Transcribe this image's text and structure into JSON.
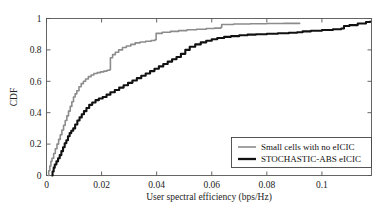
{
  "chart_data": {
    "type": "line",
    "title": "",
    "xlabel": "User spectral efficiency (bps/Hz)",
    "ylabel": "CDF",
    "xlim": [
      0,
      0.118
    ],
    "ylim": [
      0,
      1
    ],
    "xticks": [
      0,
      0.02,
      0.04,
      0.06,
      0.08,
      0.1
    ],
    "xticklabels": [
      "0",
      "0.02",
      "0.04",
      "0.06",
      "0.08",
      "0.1"
    ],
    "yticks": [
      0,
      0.2,
      0.4,
      0.6,
      0.8,
      1
    ],
    "yticklabels": [
      "0",
      "0.2",
      "0.4",
      "0.6",
      "0.8",
      "1"
    ],
    "grid": false,
    "legend_position": "lower right",
    "series": [
      {
        "name": "Small cells with no eICIC",
        "color": "#8c8c8c",
        "linewidth": 1.6,
        "points": [
          [
            0.0005,
            0.0
          ],
          [
            0.0008,
            0.03
          ],
          [
            0.0012,
            0.06
          ],
          [
            0.0016,
            0.09
          ],
          [
            0.002,
            0.11
          ],
          [
            0.0026,
            0.14
          ],
          [
            0.0032,
            0.17
          ],
          [
            0.0038,
            0.2
          ],
          [
            0.0044,
            0.23
          ],
          [
            0.005,
            0.26
          ],
          [
            0.0056,
            0.29
          ],
          [
            0.0062,
            0.32
          ],
          [
            0.0068,
            0.35
          ],
          [
            0.0074,
            0.38
          ],
          [
            0.008,
            0.41
          ],
          [
            0.0086,
            0.44
          ],
          [
            0.0092,
            0.47
          ],
          [
            0.0098,
            0.5
          ],
          [
            0.0104,
            0.52
          ],
          [
            0.011,
            0.54
          ],
          [
            0.0118,
            0.565
          ],
          [
            0.0126,
            0.585
          ],
          [
            0.0134,
            0.6
          ],
          [
            0.0142,
            0.615
          ],
          [
            0.0152,
            0.63
          ],
          [
            0.0162,
            0.64
          ],
          [
            0.0172,
            0.65
          ],
          [
            0.0184,
            0.655
          ],
          [
            0.0196,
            0.66
          ],
          [
            0.0208,
            0.665
          ],
          [
            0.022,
            0.67
          ],
          [
            0.023,
            0.675
          ],
          [
            0.0232,
            0.75
          ],
          [
            0.024,
            0.77
          ],
          [
            0.025,
            0.785
          ],
          [
            0.0262,
            0.8
          ],
          [
            0.0276,
            0.815
          ],
          [
            0.029,
            0.825
          ],
          [
            0.0306,
            0.835
          ],
          [
            0.0322,
            0.845
          ],
          [
            0.034,
            0.85
          ],
          [
            0.036,
            0.855
          ],
          [
            0.038,
            0.86
          ],
          [
            0.0394,
            0.865
          ],
          [
            0.0398,
            0.905
          ],
          [
            0.042,
            0.912
          ],
          [
            0.045,
            0.918
          ],
          [
            0.048,
            0.923
          ],
          [
            0.051,
            0.928
          ],
          [
            0.0545,
            0.932
          ],
          [
            0.058,
            0.936
          ],
          [
            0.061,
            0.939
          ],
          [
            0.0632,
            0.942
          ],
          [
            0.0636,
            0.962
          ],
          [
            0.068,
            0.965
          ],
          [
            0.074,
            0.967
          ],
          [
            0.08,
            0.968
          ],
          [
            0.086,
            0.969
          ],
          [
            0.092,
            0.97
          ]
        ]
      },
      {
        "name": "STOCHASTIC-ABS eICIC",
        "color": "#111111",
        "linewidth": 2.1,
        "points": [
          [
            0.0018,
            0.0
          ],
          [
            0.0022,
            0.025
          ],
          [
            0.0026,
            0.05
          ],
          [
            0.003,
            0.07
          ],
          [
            0.0036,
            0.09
          ],
          [
            0.0042,
            0.11
          ],
          [
            0.0048,
            0.13
          ],
          [
            0.0054,
            0.155
          ],
          [
            0.006,
            0.18
          ],
          [
            0.0066,
            0.205
          ],
          [
            0.0072,
            0.225
          ],
          [
            0.0078,
            0.25
          ],
          [
            0.0084,
            0.27
          ],
          [
            0.009,
            0.285
          ],
          [
            0.0097,
            0.3
          ],
          [
            0.0104,
            0.325
          ],
          [
            0.0112,
            0.35
          ],
          [
            0.012,
            0.37
          ],
          [
            0.0128,
            0.39
          ],
          [
            0.0136,
            0.41
          ],
          [
            0.0145,
            0.43
          ],
          [
            0.0155,
            0.45
          ],
          [
            0.0166,
            0.465
          ],
          [
            0.0178,
            0.48
          ],
          [
            0.019,
            0.49
          ],
          [
            0.0204,
            0.5
          ],
          [
            0.0218,
            0.515
          ],
          [
            0.0232,
            0.53
          ],
          [
            0.0248,
            0.545
          ],
          [
            0.0264,
            0.56
          ],
          [
            0.028,
            0.575
          ],
          [
            0.0296,
            0.59
          ],
          [
            0.0312,
            0.605
          ],
          [
            0.0328,
            0.62
          ],
          [
            0.0344,
            0.635
          ],
          [
            0.036,
            0.65
          ],
          [
            0.0376,
            0.665
          ],
          [
            0.0392,
            0.68
          ],
          [
            0.0408,
            0.695
          ],
          [
            0.0424,
            0.71
          ],
          [
            0.044,
            0.725
          ],
          [
            0.0456,
            0.74
          ],
          [
            0.0472,
            0.755
          ],
          [
            0.0488,
            0.775
          ],
          [
            0.0504,
            0.8
          ],
          [
            0.052,
            0.82
          ],
          [
            0.054,
            0.835
          ],
          [
            0.056,
            0.848
          ],
          [
            0.058,
            0.858
          ],
          [
            0.06,
            0.868
          ],
          [
            0.062,
            0.876
          ],
          [
            0.0645,
            0.883
          ],
          [
            0.067,
            0.888
          ],
          [
            0.07,
            0.893
          ],
          [
            0.073,
            0.897
          ],
          [
            0.076,
            0.9
          ],
          [
            0.08,
            0.903
          ],
          [
            0.084,
            0.906
          ],
          [
            0.088,
            0.909
          ],
          [
            0.091,
            0.912
          ],
          [
            0.093,
            0.918
          ],
          [
            0.096,
            0.922
          ],
          [
            0.1,
            0.927
          ],
          [
            0.104,
            0.932
          ],
          [
            0.107,
            0.936
          ],
          [
            0.108,
            0.952
          ],
          [
            0.11,
            0.958
          ],
          [
            0.113,
            0.968
          ],
          [
            0.116,
            0.978
          ],
          [
            0.1175,
            0.985
          ]
        ]
      }
    ]
  },
  "legend": {
    "entries": [
      {
        "label": "Small cells with no eICIC",
        "color": "#8c8c8c"
      },
      {
        "label": "STOCHASTIC-ABS eICIC",
        "color": "#111111"
      }
    ]
  }
}
